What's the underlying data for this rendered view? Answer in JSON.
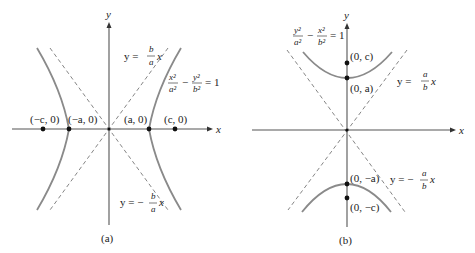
{
  "panel_a": {
    "caption": "(a)",
    "axis_x_label": "x",
    "axis_y_label": "y",
    "equation": {
      "lhs_num1": "x²",
      "lhs_den1": "a²",
      "minus": "−",
      "lhs_num2": "y²",
      "lhs_den2": "b²",
      "rhs": "= 1"
    },
    "asymptote_pos": {
      "prefix": "y =",
      "num": "b",
      "den": "a",
      "suffix": "x"
    },
    "asymptote_neg": {
      "prefix": "y = −",
      "num": "b",
      "den": "a",
      "suffix": "x"
    },
    "points": [
      {
        "label": "(−c, 0)"
      },
      {
        "label": "(−a, 0)"
      },
      {
        "label": "(a, 0)"
      },
      {
        "label": "(c, 0)"
      }
    ]
  },
  "panel_b": {
    "caption": "(b)",
    "axis_x_label": "x",
    "axis_y_label": "y",
    "equation": {
      "lhs_num1": "y²",
      "lhs_den1": "a²",
      "minus": "−",
      "lhs_num2": "x²",
      "lhs_den2": "b²",
      "rhs": "= 1"
    },
    "asymptote_pos": {
      "prefix": "y =",
      "num": "a",
      "den": "b",
      "suffix": "x"
    },
    "asymptote_neg": {
      "prefix": "y = −",
      "num": "a",
      "den": "b",
      "suffix": "x"
    },
    "points": [
      {
        "label": "(0, c)"
      },
      {
        "label": "(0, a)"
      },
      {
        "label": "(0, −a)"
      },
      {
        "label": "(0, −c)"
      }
    ]
  }
}
